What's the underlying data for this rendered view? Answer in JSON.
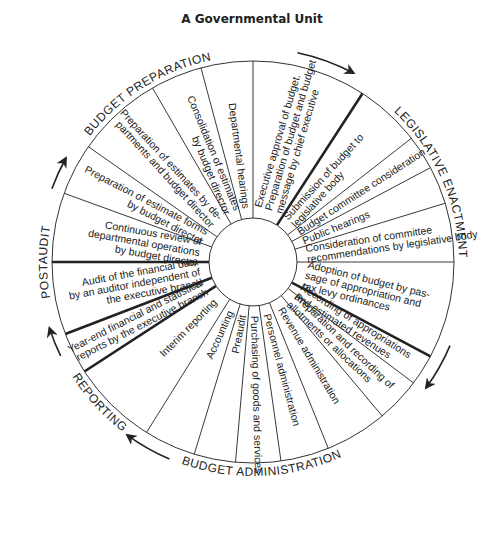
{
  "title": "A Governmental Unit",
  "diagram": {
    "type": "circular-cycle",
    "center": [
      253,
      262
    ],
    "outer_radius": 201,
    "inner_radius": 44,
    "phases": [
      {
        "label": "BUDGET PREPARATION"
      },
      {
        "label": "LEGISLATIVE ENACTMENT"
      },
      {
        "label": "BUDGET ADMINISTRATION"
      },
      {
        "label": "REPORTING"
      },
      {
        "label": "POSTAUDIT"
      }
    ],
    "steps": [
      {
        "lines": [
          "Executive approval of budget.",
          "Preparation of budget and budget",
          "message by chief executive"
        ]
      },
      {
        "lines": [
          "Submission of budget to",
          "legislative body"
        ]
      },
      {
        "lines": [
          "Budget committee consideration"
        ]
      },
      {
        "lines": [
          "Public hearings"
        ]
      },
      {
        "lines": [
          "Consideration of committee",
          "recommendations by legislative body"
        ]
      },
      {
        "lines": [
          "Adoption of budget by pas-",
          "sage of appropriation and",
          "tax levy ordinances"
        ]
      },
      {
        "lines": [
          "Recording of appropriations",
          "and estimated revenues"
        ]
      },
      {
        "lines": [
          "Preparation and recording of",
          "allotments or allocations"
        ]
      },
      {
        "lines": [
          "Revenue administration"
        ]
      },
      {
        "lines": [
          "Personnel administration"
        ]
      },
      {
        "lines": [
          "Purchasing of goods and services"
        ]
      },
      {
        "lines": [
          "Preaudit"
        ]
      },
      {
        "lines": [
          "Accounting"
        ]
      },
      {
        "lines": [
          "Interim reporting"
        ]
      },
      {
        "lines": [
          "Year-end financial and statistical",
          "reports by the executive branch"
        ]
      },
      {
        "lines": [
          "Audit of the financial data",
          "by an auditor independent of",
          "the executive branch"
        ]
      },
      {
        "lines": [
          "Continuous review of",
          "departmental operations",
          "by budget director"
        ]
      },
      {
        "lines": [
          "Preparation of estimate forms",
          "by budget director"
        ]
      },
      {
        "lines": [
          "Preparation of estimates by de-",
          "partments and budget director"
        ]
      },
      {
        "lines": [
          "Consolidation of estimates",
          "by budget director"
        ]
      },
      {
        "lines": [
          "Departmental hearings"
        ]
      }
    ]
  }
}
